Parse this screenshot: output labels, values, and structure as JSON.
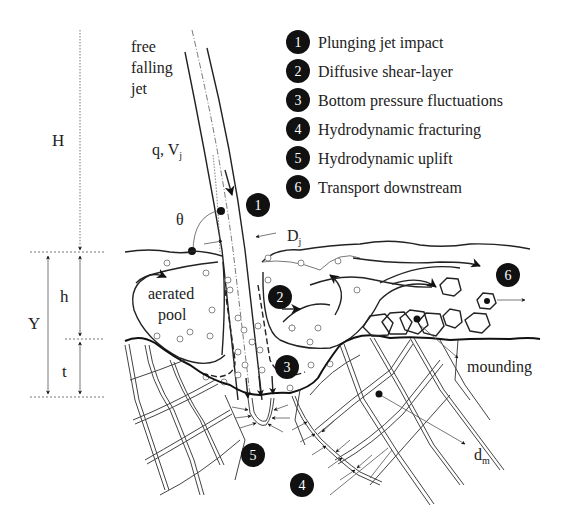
{
  "figure": {
    "type": "schematic"
  },
  "legend": [
    {
      "number": "1",
      "label": "Plunging jet impact"
    },
    {
      "number": "2",
      "label": "Diffusive shear-layer"
    },
    {
      "number": "3",
      "label": "Bottom pressure fluctuations"
    },
    {
      "number": "4",
      "label": "Hydrodynamic fracturing"
    },
    {
      "number": "5",
      "label": "Hydrodynamic uplift"
    },
    {
      "number": "6",
      "label": "Transport downstream"
    }
  ],
  "labels": {
    "jet_line1": "free",
    "jet_line2": "falling",
    "jet_line3": "jet",
    "drop_height": "H",
    "flow": "q, V",
    "flow_sub": "j",
    "angle": "θ",
    "jet_diameter": "D",
    "jet_diameter_sub": "j",
    "pool_depth": "h",
    "total_depth": "Y",
    "scour_depth": "t",
    "pool_line1": "aerated",
    "pool_line2": "pool",
    "mounding": "mounding",
    "block_size": "d",
    "block_size_sub": "m"
  },
  "markers": {
    "m1": "1",
    "m2": "2",
    "m3": "3",
    "m4": "4",
    "m5": "5",
    "m6": "6"
  },
  "colors": {
    "ink": "#111111",
    "background": "#ffffff",
    "marker_fill": "#111111",
    "marker_text": "#ffffff"
  }
}
